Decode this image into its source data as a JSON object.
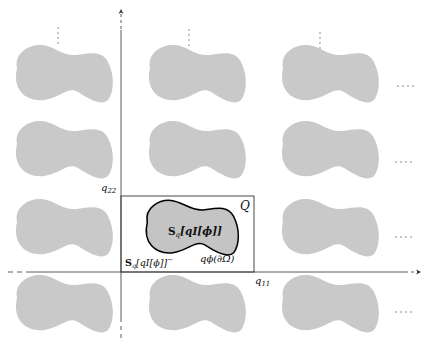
{
  "figure": {
    "type": "periodic-lattice-diagram",
    "colors": {
      "inclusion_fill": "#c8c8c8",
      "highlight_fill": "#c4c4c4",
      "outline": "#000000",
      "axis": "#333333",
      "box": "#333333",
      "ellipsis": "#aaaaaa"
    },
    "axes": {
      "horizontal_label": "q",
      "horizontal_sub": "11",
      "vertical_label": "q",
      "vertical_sub": "22"
    },
    "cell": {
      "label": "Q"
    },
    "inclusion": {
      "interior_label_S": "S",
      "interior_label_sub": "q",
      "interior_label_rest": "[qI[ϕ]]",
      "boundary_label": "qϕ(∂Ω)",
      "exterior_label_S": "S",
      "exterior_label_sub": "q",
      "exterior_label_rest": "[qI[ϕ]]",
      "exterior_label_sup": "−"
    },
    "lattice": {
      "rows": 4,
      "columns": 3,
      "row_pitch_px": 77,
      "column_pitch_px": 133
    },
    "ellipsis": {
      "vertical": "⋮",
      "horizontal": "····"
    }
  }
}
